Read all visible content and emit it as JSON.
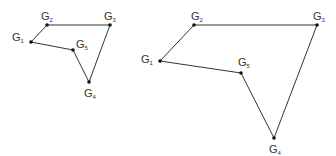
{
  "figures": [
    {
      "name": "small-polygon",
      "nodes": [
        {
          "id": "G1",
          "base": "G",
          "sub": "1"
        },
        {
          "id": "G2",
          "base": "G",
          "sub": "2"
        },
        {
          "id": "G3",
          "base": "G",
          "sub": "3"
        },
        {
          "id": "G4",
          "base": "G",
          "sub": "4"
        },
        {
          "id": "G5",
          "base": "G",
          "sub": "5"
        }
      ],
      "edges": [
        [
          "G1",
          "G2"
        ],
        [
          "G2",
          "G3"
        ],
        [
          "G3",
          "G4"
        ],
        [
          "G4",
          "G5"
        ],
        [
          "G5",
          "G1"
        ]
      ]
    },
    {
      "name": "large-polygon",
      "nodes": [
        {
          "id": "G1",
          "base": "G",
          "sub": "1"
        },
        {
          "id": "G2",
          "base": "G",
          "sub": "2"
        },
        {
          "id": "G3",
          "base": "G",
          "sub": "3"
        },
        {
          "id": "G4",
          "base": "G",
          "sub": "4"
        },
        {
          "id": "G5",
          "base": "G",
          "sub": "5"
        }
      ],
      "edges": [
        [
          "G1",
          "G2"
        ],
        [
          "G2",
          "G3"
        ],
        [
          "G3",
          "G4"
        ],
        [
          "G4",
          "G5"
        ],
        [
          "G5",
          "G1"
        ]
      ]
    }
  ]
}
